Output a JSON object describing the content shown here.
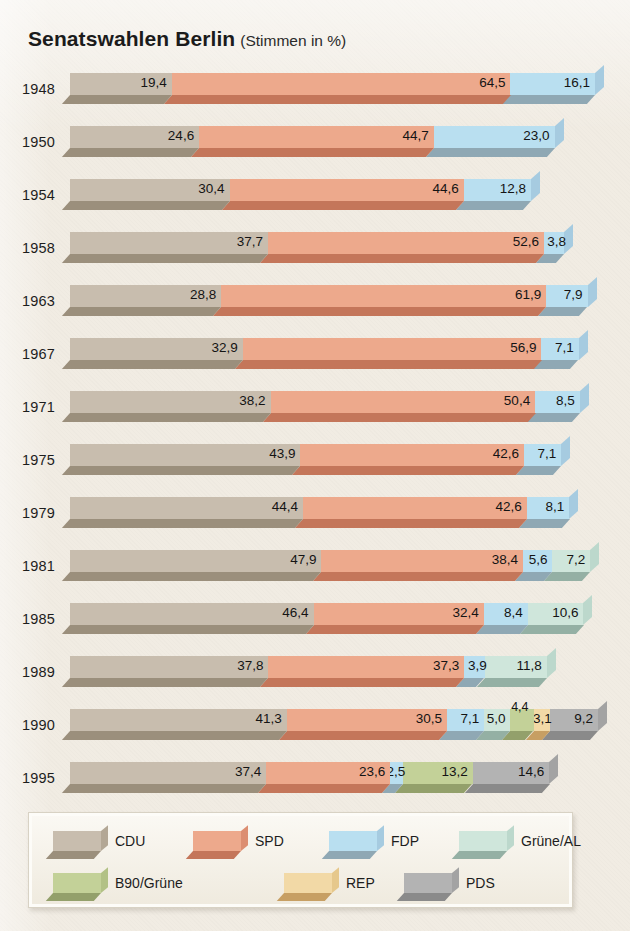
{
  "title": {
    "main": "Senatswahlen Berlin",
    "sub": "(Stimmen in %)"
  },
  "legend": {
    "items": [
      {
        "key": "cdu",
        "label": "CDU",
        "color": "#c8bdae",
        "bevel": "#9b8f7c",
        "side": "#b3a795"
      },
      {
        "key": "spd",
        "label": "SPD",
        "color": "#eda98c",
        "bevel": "#c4765a",
        "side": "#dc8e71"
      },
      {
        "key": "fdp",
        "label": "FDP",
        "color": "#b9dff0",
        "bevel": "#8fa8b4",
        "side": "#a6cbe0"
      },
      {
        "key": "gruene_al",
        "label": "Grüne/AL",
        "color": "#cfe6db",
        "bevel": "#94b0a4",
        "side": "#bcd8cc"
      },
      {
        "key": "b90",
        "label": "B90/Grüne",
        "color": "#c3d198",
        "bevel": "#93a06b",
        "side": "#b2c185"
      },
      {
        "key": "rep",
        "label": "REP",
        "color": "#f2d9a6",
        "bevel": "#c79f63",
        "side": "#e6c88c"
      },
      {
        "key": "pds",
        "label": "PDS",
        "color": "#b3b3b3",
        "bevel": "#8a8a8a",
        "side": "#a3a3a3"
      }
    ]
  },
  "chart_data": {
    "type": "bar",
    "orientation": "horizontal-stacked",
    "xlabel": "",
    "ylabel": "",
    "unit": "%",
    "xlim": [
      0,
      100
    ],
    "grid": false,
    "legend_position": "bottom",
    "categories": [
      "1948",
      "1950",
      "1954",
      "1958",
      "1963",
      "1967",
      "1971",
      "1975",
      "1979",
      "1981",
      "1985",
      "1989",
      "1990",
      "1995"
    ],
    "series": [
      {
        "name": "CDU",
        "key": "cdu",
        "values": [
          19.4,
          24.6,
          30.4,
          37.7,
          28.8,
          32.9,
          38.2,
          43.9,
          44.4,
          47.9,
          46.4,
          37.8,
          41.3,
          37.4
        ]
      },
      {
        "name": "SPD",
        "key": "spd",
        "values": [
          64.5,
          44.7,
          44.6,
          52.6,
          61.9,
          56.9,
          50.4,
          42.6,
          42.6,
          38.4,
          32.4,
          37.3,
          30.5,
          23.6
        ]
      },
      {
        "name": "FDP",
        "key": "fdp",
        "values": [
          16.1,
          23.0,
          12.8,
          3.8,
          7.9,
          7.1,
          8.5,
          7.1,
          8.1,
          5.6,
          8.4,
          3.9,
          7.1,
          2.5
        ]
      },
      {
        "name": "Grüne/AL",
        "key": "gruene_al",
        "values": [
          null,
          null,
          null,
          null,
          null,
          null,
          null,
          null,
          null,
          7.2,
          10.6,
          11.8,
          5.0,
          null
        ]
      },
      {
        "name": "B90/Grüne",
        "key": "b90",
        "values": [
          null,
          null,
          null,
          null,
          null,
          null,
          null,
          null,
          null,
          null,
          null,
          null,
          4.4,
          13.2
        ]
      },
      {
        "name": "REP",
        "key": "rep",
        "values": [
          null,
          null,
          null,
          null,
          null,
          null,
          null,
          null,
          null,
          null,
          null,
          null,
          3.1,
          null
        ]
      },
      {
        "name": "PDS",
        "key": "pds",
        "values": [
          null,
          null,
          null,
          null,
          null,
          null,
          null,
          null,
          null,
          null,
          null,
          null,
          9.2,
          14.6
        ]
      }
    ],
    "rows": [
      {
        "year": "1948",
        "segments": [
          {
            "key": "cdu",
            "label": "19,4",
            "value": 19.4
          },
          {
            "key": "spd",
            "label": "64,5",
            "value": 64.5
          },
          {
            "key": "fdp",
            "label": "16,1",
            "value": 16.1
          }
        ]
      },
      {
        "year": "1950",
        "segments": [
          {
            "key": "cdu",
            "label": "24,6",
            "value": 24.6
          },
          {
            "key": "spd",
            "label": "44,7",
            "value": 44.7
          },
          {
            "key": "fdp",
            "label": "23,0",
            "value": 23.0
          }
        ]
      },
      {
        "year": "1954",
        "segments": [
          {
            "key": "cdu",
            "label": "30,4",
            "value": 30.4
          },
          {
            "key": "spd",
            "label": "44,6",
            "value": 44.6
          },
          {
            "key": "fdp",
            "label": "12,8",
            "value": 12.8
          }
        ]
      },
      {
        "year": "1958",
        "segments": [
          {
            "key": "cdu",
            "label": "37,7",
            "value": 37.7
          },
          {
            "key": "spd",
            "label": "52,6",
            "value": 52.6
          },
          {
            "key": "fdp",
            "label": "3,8",
            "value": 3.8,
            "outside": true
          }
        ]
      },
      {
        "year": "1963",
        "segments": [
          {
            "key": "cdu",
            "label": "28,8",
            "value": 28.8
          },
          {
            "key": "spd",
            "label": "61,9",
            "value": 61.9
          },
          {
            "key": "fdp",
            "label": "7,9",
            "value": 7.9
          }
        ]
      },
      {
        "year": "1967",
        "segments": [
          {
            "key": "cdu",
            "label": "32,9",
            "value": 32.9
          },
          {
            "key": "spd",
            "label": "56,9",
            "value": 56.9
          },
          {
            "key": "fdp",
            "label": "7,1",
            "value": 7.1
          }
        ]
      },
      {
        "year": "1971",
        "segments": [
          {
            "key": "cdu",
            "label": "38,2",
            "value": 38.2
          },
          {
            "key": "spd",
            "label": "50,4",
            "value": 50.4
          },
          {
            "key": "fdp",
            "label": "8,5",
            "value": 8.5
          }
        ]
      },
      {
        "year": "1975",
        "segments": [
          {
            "key": "cdu",
            "label": "43,9",
            "value": 43.9
          },
          {
            "key": "spd",
            "label": "42,6",
            "value": 42.6
          },
          {
            "key": "fdp",
            "label": "7,1",
            "value": 7.1
          }
        ]
      },
      {
        "year": "1979",
        "segments": [
          {
            "key": "cdu",
            "label": "44,4",
            "value": 44.4
          },
          {
            "key": "spd",
            "label": "42,6",
            "value": 42.6
          },
          {
            "key": "fdp",
            "label": "8,1",
            "value": 8.1
          }
        ]
      },
      {
        "year": "1981",
        "segments": [
          {
            "key": "cdu",
            "label": "47,9",
            "value": 47.9
          },
          {
            "key": "spd",
            "label": "38,4",
            "value": 38.4
          },
          {
            "key": "fdp",
            "label": "5,6",
            "value": 5.6
          },
          {
            "key": "gruene_al",
            "label": "7,2",
            "value": 7.2
          }
        ]
      },
      {
        "year": "1985",
        "segments": [
          {
            "key": "cdu",
            "label": "46,4",
            "value": 46.4
          },
          {
            "key": "spd",
            "label": "32,4",
            "value": 32.4
          },
          {
            "key": "fdp",
            "label": "8,4",
            "value": 8.4
          },
          {
            "key": "gruene_al",
            "label": "10,6",
            "value": 10.6
          }
        ]
      },
      {
        "year": "1989",
        "segments": [
          {
            "key": "cdu",
            "label": "37,8",
            "value": 37.8
          },
          {
            "key": "spd",
            "label": "37,3",
            "value": 37.3
          },
          {
            "key": "fdp",
            "label": "3,9",
            "value": 3.9,
            "outside": true
          },
          {
            "key": "gruene_al",
            "label": "11,8",
            "value": 11.8
          }
        ]
      },
      {
        "year": "1990",
        "segments": [
          {
            "key": "cdu",
            "label": "41,3",
            "value": 41.3
          },
          {
            "key": "spd",
            "label": "30,5",
            "value": 30.5
          },
          {
            "key": "fdp",
            "label": "7,1",
            "value": 7.1
          },
          {
            "key": "gruene_al",
            "label": "5,0",
            "value": 5.0
          },
          {
            "key": "b90",
            "label": "4,4",
            "value": 4.4,
            "raised": true
          },
          {
            "key": "rep",
            "label": "3,1",
            "value": 3.1,
            "outside": true
          },
          {
            "key": "pds",
            "label": "9,2",
            "value": 9.2
          }
        ]
      },
      {
        "year": "1995",
        "segments": [
          {
            "key": "cdu",
            "label": "37,4",
            "value": 37.4
          },
          {
            "key": "spd",
            "label": "23,6",
            "value": 23.6
          },
          {
            "key": "fdp",
            "label": "2,5",
            "value": 2.5,
            "outside": true
          },
          {
            "key": "b90",
            "label": "13,2",
            "value": 13.2
          },
          {
            "key": "pds",
            "label": "14,6",
            "value": 14.6
          }
        ]
      }
    ]
  }
}
